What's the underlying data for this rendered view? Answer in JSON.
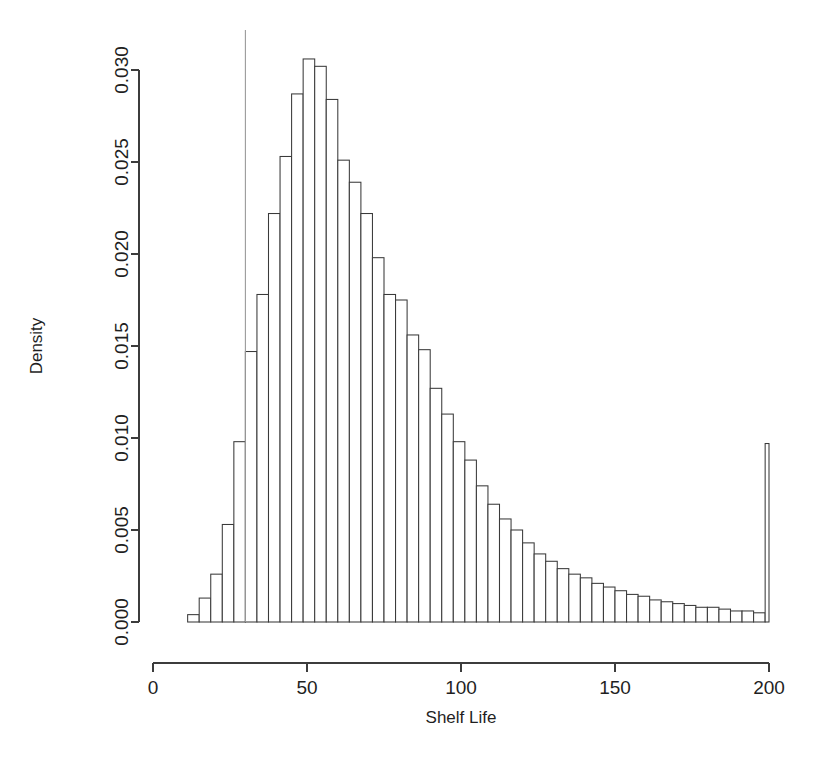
{
  "figure": {
    "background_color": "#ffffff",
    "ink_color": "#3c3c3c",
    "bar_fill": "#ffffff",
    "bar_stroke": "#3a3a3a",
    "vline_color": "#9a9a9a",
    "caption_partial": ""
  },
  "chart_data": {
    "type": "bar",
    "subtype": "histogram",
    "title": "",
    "xlabel": "Shelf Life",
    "ylabel": "Density",
    "xlim": [
      0,
      200
    ],
    "ylim": [
      0,
      0.0306
    ],
    "grid": false,
    "legend": null,
    "x_ticks": [
      0,
      50,
      100,
      150,
      200
    ],
    "x_tick_labels": [
      "0",
      "50",
      "100",
      "150",
      "200"
    ],
    "y_ticks": [
      0.0,
      0.005,
      0.01,
      0.015,
      0.02,
      0.025,
      0.03
    ],
    "y_tick_labels": [
      "0.000",
      "0.005",
      "0.010",
      "0.015",
      "0.020",
      "0.025",
      "0.030"
    ],
    "bin_width": 3.75,
    "bin_starts": [
      11.25,
      15.0,
      18.75,
      22.5,
      26.25,
      30.0,
      33.75,
      37.5,
      41.25,
      45.0,
      48.75,
      52.5,
      56.25,
      60.0,
      63.75,
      67.5,
      71.25,
      75.0,
      78.75,
      82.5,
      86.25,
      90.0,
      93.75,
      97.5,
      101.25,
      105.0,
      108.75,
      112.5,
      116.25,
      120.0,
      123.75,
      127.5,
      131.25,
      135.0,
      138.75,
      142.5,
      146.25,
      150.0,
      153.75,
      157.5,
      161.25,
      165.0,
      168.75,
      172.5,
      176.25,
      180.0,
      183.75,
      187.5,
      191.25,
      195.0,
      198.75
    ],
    "values": [
      0.0004,
      0.0013,
      0.0026,
      0.0053,
      0.0098,
      0.0147,
      0.0178,
      0.0222,
      0.0253,
      0.0287,
      0.0306,
      0.0302,
      0.0284,
      0.0251,
      0.0239,
      0.0222,
      0.0198,
      0.0178,
      0.0175,
      0.0156,
      0.0148,
      0.0127,
      0.0113,
      0.0098,
      0.0088,
      0.0074,
      0.0064,
      0.0056,
      0.005,
      0.0043,
      0.0037,
      0.0033,
      0.0029,
      0.0026,
      0.0024,
      0.0021,
      0.0019,
      0.0017,
      0.0015,
      0.0014,
      0.0012,
      0.0011,
      0.001,
      0.0009,
      0.0008,
      0.0008,
      0.0007,
      0.0006,
      0.0006,
      0.0005,
      0.0097
    ],
    "reference_line": {
      "orientation": "vertical",
      "x": 30,
      "color": "#9a9a9a"
    }
  }
}
